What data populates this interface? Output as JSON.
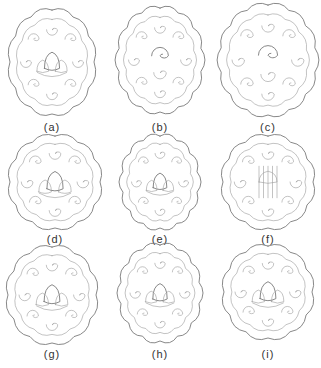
{
  "figure": {
    "panels": [
      {
        "id": "a",
        "label": "(a)",
        "shape": "round-cloud",
        "cx": 52,
        "cy": 62,
        "rx": 42,
        "ry": 52,
        "label_y": 121
      },
      {
        "id": "b",
        "label": "(b)",
        "shape": "square-cloud",
        "cx": 160,
        "cy": 60,
        "rx": 42,
        "ry": 52,
        "label_y": 121
      },
      {
        "id": "c",
        "label": "(c)",
        "shape": "oval-cloud",
        "cx": 268,
        "cy": 60,
        "rx": 48,
        "ry": 55,
        "label_y": 121
      },
      {
        "id": "d",
        "label": "(d)",
        "shape": "round-lotus",
        "cx": 55,
        "cy": 182,
        "rx": 45,
        "ry": 46,
        "label_y": 233
      },
      {
        "id": "e",
        "label": "(e)",
        "shape": "oval-lotus",
        "cx": 160,
        "cy": 182,
        "rx": 38,
        "ry": 46,
        "label_y": 233
      },
      {
        "id": "f",
        "label": "(f)",
        "shape": "round-dense",
        "cx": 268,
        "cy": 182,
        "rx": 45,
        "ry": 46,
        "label_y": 233
      },
      {
        "id": "g",
        "label": "(g)",
        "shape": "round-floral",
        "cx": 52,
        "cy": 295,
        "rx": 44,
        "ry": 48,
        "label_y": 348
      },
      {
        "id": "h",
        "label": "(h)",
        "shape": "oval-floral",
        "cx": 160,
        "cy": 293,
        "rx": 40,
        "ry": 48,
        "label_y": 348
      },
      {
        "id": "i",
        "label": "(i)",
        "shape": "round-open-lotus",
        "cx": 268,
        "cy": 292,
        "rx": 44,
        "ry": 46,
        "label_y": 348
      }
    ],
    "stroke_color": "#7a7a7a",
    "background": "#ffffff"
  }
}
